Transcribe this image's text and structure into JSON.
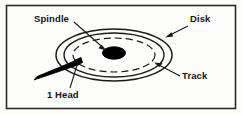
{
  "figure": {
    "frame": {
      "border_color": "#2b2b2b",
      "background_color": "#fdfdfc"
    },
    "colors": {
      "ink": "#151515",
      "line": "#1a1a1a",
      "spindle_fill": "#000000",
      "head_fill": "#000000",
      "page": "#fdfdfc"
    },
    "labels": {
      "spindle": "Spindle",
      "disk": "Disk",
      "track": "Track",
      "head": "1 Head"
    },
    "parts": [
      {
        "name": "disk-platter",
        "label": "Disk",
        "shape": "ellipse",
        "style": "solid",
        "cx": 114,
        "cy": 55,
        "rx": 58,
        "ry": 26
      },
      {
        "name": "disk-inner-edge",
        "label": "",
        "shape": "ellipse",
        "style": "solid",
        "cx": 114,
        "cy": 55,
        "rx": 50,
        "ry": 22
      },
      {
        "name": "track",
        "label": "Track",
        "shape": "ellipse",
        "style": "dashed",
        "cx": 114,
        "cy": 55,
        "rx": 41,
        "ry": 17
      },
      {
        "name": "spindle",
        "label": "Spindle",
        "shape": "filled-ellipse",
        "cx": 114,
        "cy": 53,
        "rx": 11,
        "ry": 6
      },
      {
        "name": "head-arm",
        "label": "1 Head",
        "shape": "wedge"
      }
    ],
    "leaders": [
      {
        "name": "spindle-leader",
        "from_label": "Spindle",
        "to_part": "spindle",
        "arrow": true
      },
      {
        "name": "disk-leader",
        "from_label": "Disk",
        "to_part": "disk-platter",
        "arrow": true
      },
      {
        "name": "track-leader",
        "from_label": "Track",
        "to_part": "track",
        "arrow": true
      },
      {
        "name": "head-leader",
        "from_label": "1 Head",
        "to_part": "head-arm",
        "arrow": false
      }
    ]
  }
}
